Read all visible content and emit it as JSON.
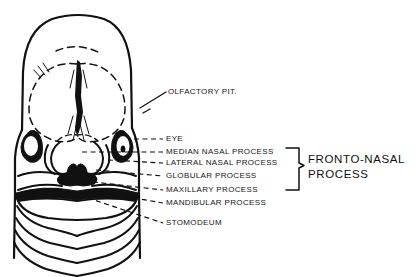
{
  "figure": {
    "type": "anatomical-line-drawing",
    "view": "anterior",
    "line_color": "#111111",
    "background_color": "#ffffff",
    "leader_line_style": "dashed"
  },
  "labels": {
    "olfactory_pit": "OLFACTORY PIT.",
    "eye": "EYE",
    "median_nasal_process": "MEDIAN NASAL PROCESS",
    "lateral_nasal_process": "LATERAL NASAL PROCESS",
    "globular_process": "GLOBULAR PROCESS",
    "maxillary_process": "MAXILLARY PROCESS",
    "mandibular_process": "MANDIBULAR PROCESS",
    "stomodeum": "STOMODEUM"
  },
  "group_bracket": {
    "line1": "FRONTO-NASAL",
    "line2": "PROCESS",
    "groups_labels": [
      "MEDIAN NASAL PROCESS",
      "LATERAL NASAL PROCESS",
      "GLOBULAR PROCESS",
      "MAXILLARY PROCESS"
    ]
  }
}
